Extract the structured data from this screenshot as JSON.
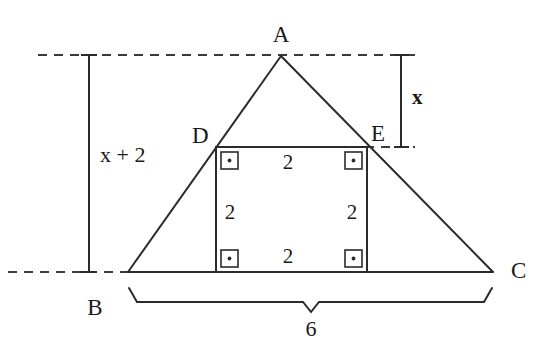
{
  "figure": {
    "kind": "geometry-diagram",
    "stroke_color": "#2b2b2b",
    "text_color": "#1a1a1a",
    "background_color": "#ffffff"
  },
  "vertices": {
    "a": {
      "label": "A",
      "x": 281,
      "y": 56,
      "label_x": 281,
      "label_y": 23
    },
    "b": {
      "label": "B",
      "x": 128,
      "y": 272,
      "label_x": 95,
      "label_y": 296
    },
    "c": {
      "label": "C",
      "x": 493,
      "y": 272,
      "label_x": 516,
      "label_y": 259
    },
    "d": {
      "label": "D",
      "x": 216,
      "y": 147,
      "label_x": 198,
      "label_y": 124
    },
    "e": {
      "label": "E",
      "x": 367,
      "y": 147,
      "label_x": 376,
      "label_y": 122
    }
  },
  "square": {
    "left": 216,
    "right": 367,
    "top": 147,
    "bottom": 272,
    "side_labels": [
      {
        "name": "top",
        "text": "2",
        "x": 288,
        "y": 152
      },
      {
        "name": "left",
        "text": "2",
        "x": 228,
        "y": 202
      },
      {
        "name": "right",
        "text": "2",
        "x": 350,
        "y": 202
      },
      {
        "name": "bottom",
        "text": "2",
        "x": 288,
        "y": 246
      }
    ],
    "right_angle_marks": [
      {
        "name": "top-left",
        "x": 221,
        "y": 152
      },
      {
        "name": "top-right",
        "x": 346,
        "y": 152
      },
      {
        "name": "bottom-left",
        "x": 221,
        "y": 252
      },
      {
        "name": "bottom-right",
        "x": 346,
        "y": 252
      }
    ]
  },
  "measures": {
    "total_height": {
      "name": "x-plus-2",
      "text": "x + 2",
      "line_x": 89,
      "top_y": 55,
      "bottom_y": 272,
      "label_x": 100,
      "label_y": 144
    },
    "upper_height": {
      "name": "x",
      "text": "x",
      "line_x": 401,
      "top_y": 55,
      "bottom_y": 147,
      "label_x": 412,
      "label_y": 87
    },
    "base": {
      "name": "base-6",
      "text": "6",
      "left_x": 128,
      "right_x": 492,
      "brace_y": 300,
      "label_x": 310,
      "label_y": 318
    }
  },
  "guide_lines": {
    "top_dashed": {
      "x1": 38,
      "x2": 415,
      "y": 55
    },
    "bottom_dashed": {
      "x1": 8,
      "x2": 130,
      "y": 272
    },
    "right_dashed": {
      "x1": 365,
      "x2": 415,
      "y": 147
    }
  }
}
